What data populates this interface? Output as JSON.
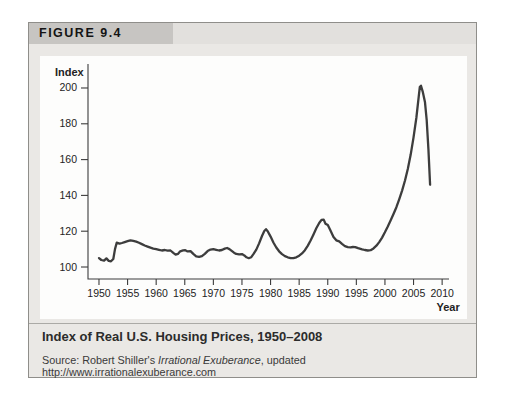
{
  "figure": {
    "label": "FIGURE 9.4",
    "caption": "Index of Real U.S. Housing Prices, 1950–2008",
    "source": {
      "prefix": "Source: Robert Shiller's ",
      "italic": "Irrational Exuberance",
      "suffix": ", updated http://www.irrationalexuberance.com"
    }
  },
  "colors": {
    "card_bg": "#eae8e5",
    "header_tab_bg": "#c7c5c2",
    "axis": "#3c3c3c",
    "tick_text": "#232323",
    "line": "#3d3d3d"
  },
  "chart_data": {
    "type": "line",
    "title": "Index of Real U.S. Housing Prices, 1950–2008",
    "xlabel": "Year",
    "ylabel": "Index",
    "xlim": [
      1948.08,
      2011.2
    ],
    "ylim": [
      93.3,
      213.4
    ],
    "xticks": [
      1950,
      1955,
      1960,
      1965,
      1970,
      1975,
      1980,
      1985,
      1990,
      1995,
      2000,
      2005,
      2010
    ],
    "yticks": [
      100,
      120,
      140,
      160,
      180,
      200
    ],
    "grid": false,
    "legend": "none",
    "series": [
      {
        "name": "Real U.S. housing price index",
        "color": "#3d3d3d",
        "points": [
          [
            1950,
            105
          ],
          [
            1950.4,
            103.9
          ],
          [
            1950.9,
            103.6
          ],
          [
            1951.3,
            104.8
          ],
          [
            1951.7,
            103.4
          ],
          [
            1952.1,
            103.2
          ],
          [
            1952.5,
            104.5
          ],
          [
            1952.8,
            110
          ],
          [
            1953.1,
            113.6
          ],
          [
            1953.6,
            113.1
          ],
          [
            1954,
            113.4
          ],
          [
            1954.5,
            113.9
          ],
          [
            1955,
            114.4
          ],
          [
            1955.5,
            114.9
          ],
          [
            1956,
            114.6
          ],
          [
            1956.5,
            114.2
          ],
          [
            1957,
            113.6
          ],
          [
            1957.5,
            112.8
          ],
          [
            1958,
            112
          ],
          [
            1958.5,
            111.4
          ],
          [
            1959,
            110.8
          ],
          [
            1959.5,
            110.3
          ],
          [
            1960,
            110
          ],
          [
            1960.5,
            109.6
          ],
          [
            1961,
            109.2
          ],
          [
            1961.5,
            109.5
          ],
          [
            1962,
            109.1
          ],
          [
            1962.5,
            109.2
          ],
          [
            1963,
            107.9
          ],
          [
            1963.4,
            106.9
          ],
          [
            1963.8,
            107.3
          ],
          [
            1964.2,
            108.8
          ],
          [
            1964.7,
            109.3
          ],
          [
            1965.1,
            109.4
          ],
          [
            1965.5,
            108.7
          ],
          [
            1966,
            108.9
          ],
          [
            1966.5,
            107.3
          ],
          [
            1967,
            105.9
          ],
          [
            1967.5,
            105.7
          ],
          [
            1968,
            106.1
          ],
          [
            1968.5,
            107.4
          ],
          [
            1969,
            108.9
          ],
          [
            1969.5,
            109.7
          ],
          [
            1970,
            110
          ],
          [
            1970.5,
            109.6
          ],
          [
            1971,
            109.2
          ],
          [
            1971.5,
            109.5
          ],
          [
            1972,
            110.3
          ],
          [
            1972.4,
            110.6
          ],
          [
            1972.8,
            110
          ],
          [
            1973.2,
            109
          ],
          [
            1973.6,
            108
          ],
          [
            1974,
            107.3
          ],
          [
            1974.5,
            107.1
          ],
          [
            1975,
            107.2
          ],
          [
            1975.4,
            106.5
          ],
          [
            1975.8,
            105.4
          ],
          [
            1976.2,
            104.9
          ],
          [
            1976.6,
            105.4
          ],
          [
            1977,
            107.2
          ],
          [
            1977.5,
            109.7
          ],
          [
            1978,
            113.2
          ],
          [
            1978.5,
            117.3
          ],
          [
            1978.9,
            120.1
          ],
          [
            1979.2,
            121.1
          ],
          [
            1979.5,
            120
          ],
          [
            1980,
            117
          ],
          [
            1980.5,
            113.7
          ],
          [
            1981,
            110.9
          ],
          [
            1981.5,
            108.8
          ],
          [
            1982,
            107.2
          ],
          [
            1982.5,
            106.1
          ],
          [
            1983,
            105.4
          ],
          [
            1983.5,
            105
          ],
          [
            1984,
            105
          ],
          [
            1984.5,
            105.4
          ],
          [
            1985,
            106.3
          ],
          [
            1985.5,
            107.6
          ],
          [
            1986,
            109.4
          ],
          [
            1986.5,
            111.8
          ],
          [
            1987,
            114.8
          ],
          [
            1987.5,
            118.2
          ],
          [
            1988,
            121.6
          ],
          [
            1988.5,
            124.6
          ],
          [
            1988.9,
            126.3
          ],
          [
            1989.3,
            126.5
          ],
          [
            1989.6,
            124.2
          ],
          [
            1990,
            123.4
          ],
          [
            1990.4,
            121
          ],
          [
            1991,
            116.8
          ],
          [
            1991.5,
            114.9
          ],
          [
            1992,
            114.3
          ],
          [
            1992.5,
            112.9
          ],
          [
            1993,
            111.7
          ],
          [
            1993.5,
            111.1
          ],
          [
            1994,
            111
          ],
          [
            1994.4,
            111.2
          ],
          [
            1994.8,
            111.1
          ],
          [
            1995.3,
            110.5
          ],
          [
            1996,
            109.9
          ],
          [
            1996.5,
            109.5
          ],
          [
            1997,
            109.2
          ],
          [
            1997.5,
            109.4
          ],
          [
            1998,
            110.4
          ],
          [
            1998.5,
            111.9
          ],
          [
            1999,
            113.9
          ],
          [
            1999.5,
            116.4
          ],
          [
            2000,
            119.4
          ],
          [
            2000.5,
            122.6
          ],
          [
            2001,
            126.1
          ],
          [
            2001.5,
            129.6
          ],
          [
            2002,
            133.4
          ],
          [
            2002.5,
            137.8
          ],
          [
            2003,
            142.7
          ],
          [
            2003.5,
            148.3
          ],
          [
            2004,
            154.8
          ],
          [
            2004.5,
            162.8
          ],
          [
            2005,
            172.3
          ],
          [
            2005.5,
            183.5
          ],
          [
            2005.9,
            195
          ],
          [
            2006.1,
            200.5
          ],
          [
            2006.3,
            201.3
          ],
          [
            2006.6,
            198
          ],
          [
            2007,
            192
          ],
          [
            2007.3,
            182
          ],
          [
            2007.6,
            166
          ],
          [
            2007.9,
            146
          ]
        ]
      }
    ]
  }
}
